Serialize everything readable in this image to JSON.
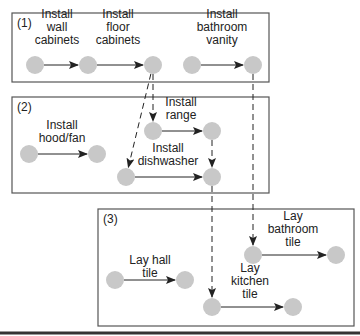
{
  "colors": {
    "node_fill": "#c8c8c8",
    "line": "#222222",
    "box_stroke": "#555555",
    "bottom_rule": "#333333"
  },
  "groups": [
    {
      "id": "g1",
      "label": "(1)",
      "x": 12,
      "y": 13,
      "w": 257,
      "h": 69
    },
    {
      "id": "g2",
      "label": "(2)",
      "x": 12,
      "y": 97,
      "w": 257,
      "h": 96
    },
    {
      "id": "g3",
      "label": "(3)",
      "x": 98,
      "y": 209,
      "w": 256,
      "h": 117
    }
  ],
  "nodes": {
    "n1": {
      "x": 35,
      "y": 65
    },
    "n2": {
      "x": 88,
      "y": 65
    },
    "n3": {
      "x": 153,
      "y": 65
    },
    "n4": {
      "x": 192,
      "y": 65
    },
    "n5": {
      "x": 253,
      "y": 65
    },
    "n6": {
      "x": 29,
      "y": 154
    },
    "n7": {
      "x": 97,
      "y": 154
    },
    "n8": {
      "x": 153,
      "y": 131
    },
    "n9": {
      "x": 212,
      "y": 131
    },
    "n10": {
      "x": 126,
      "y": 177
    },
    "n11": {
      "x": 212,
      "y": 177
    },
    "n12": {
      "x": 115,
      "y": 280
    },
    "n13": {
      "x": 185,
      "y": 280
    },
    "n14": {
      "x": 253,
      "y": 255
    },
    "n15": {
      "x": 336,
      "y": 255
    },
    "n16": {
      "x": 212,
      "y": 307
    },
    "n17": {
      "x": 293,
      "y": 307
    }
  },
  "activities": [
    {
      "id": "a1",
      "from": "n1",
      "to": "n2",
      "label_lines": [
        "Install",
        "wall",
        "cabinets"
      ],
      "label_x": 57,
      "label_y": 18
    },
    {
      "id": "a2",
      "from": "n2",
      "to": "n3",
      "label_lines": [
        "Install",
        "floor",
        "cabinets"
      ],
      "label_x": 118,
      "label_y": 18
    },
    {
      "id": "a3",
      "from": "n4",
      "to": "n5",
      "label_lines": [
        "Install",
        "bathroom",
        "vanity"
      ],
      "label_x": 222,
      "label_y": 18
    },
    {
      "id": "a4",
      "from": "n6",
      "to": "n7",
      "label_lines": [
        "Install",
        "hood/fan"
      ],
      "label_x": 62,
      "label_y": 129
    },
    {
      "id": "a5",
      "from": "n8",
      "to": "n9",
      "label_lines": [
        "Install",
        "range"
      ],
      "label_x": 181,
      "label_y": 106
    },
    {
      "id": "a6",
      "from": "n10",
      "to": "n11",
      "label_lines": [
        "Install",
        "dishwasher"
      ],
      "label_x": 168,
      "label_y": 152
    },
    {
      "id": "a7",
      "from": "n12",
      "to": "n13",
      "label_lines": [
        "Lay hall",
        "tile"
      ],
      "label_x": 150,
      "label_y": 264
    },
    {
      "id": "a8",
      "from": "n14",
      "to": "n15",
      "label_lines": [
        "Lay",
        "bathroom",
        "tile"
      ],
      "label_x": 293,
      "label_y": 220
    },
    {
      "id": "a9",
      "from": "n16",
      "to": "n17",
      "label_lines": [
        "Lay",
        "kitchen",
        "tile"
      ],
      "label_x": 250,
      "label_y": 272
    }
  ],
  "dependencies": [
    {
      "id": "d1",
      "from": "n3",
      "to": "n8"
    },
    {
      "id": "d2",
      "from": "n3",
      "to": "n10"
    },
    {
      "id": "d3",
      "from": "n9",
      "to": "n11"
    },
    {
      "id": "d4",
      "from": "n11",
      "to": "n16"
    },
    {
      "id": "d5",
      "from": "n5",
      "to": "n14"
    }
  ]
}
